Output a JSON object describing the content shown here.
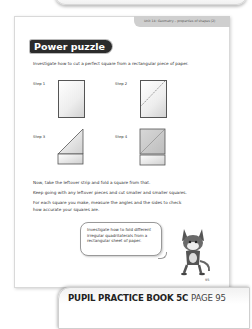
{
  "header": {
    "unit_label": "Unit 14: Geometry – properties of shapes (2)"
  },
  "section": {
    "title": "Power puzzle",
    "intro": "Investigate how to cut a perfect square from a rectangular piece of paper."
  },
  "steps": [
    {
      "label": "Step 1",
      "illustration": "rectangle-paper"
    },
    {
      "label": "Step 2",
      "illustration": "rectangle-paper-diagonal-fold-line"
    },
    {
      "label": "Step 3",
      "illustration": "folded-triangle-with-strip"
    },
    {
      "label": "Step 4",
      "illustration": "square-with-diagonal-and-strip"
    }
  ],
  "instructions": [
    "Now, take the leftover strip and fold a square from that.",
    "Keep going with any leftover pieces and cut smaller and smaller squares.",
    "For each square you make, measure the angles and the sides to check",
    "how accurate your squares are."
  ],
  "speech_bubble": {
    "lines": [
      "Investigate how to fold different",
      "irregular quadrilaterals from a",
      "rectangular sheet of paper."
    ]
  },
  "page_number": "95",
  "footer": {
    "book": "PUPIL PRACTICE BOOK 5C",
    "page": "PAGE 95"
  },
  "colors": {
    "title_badge_bg": "#2b2b2b",
    "unit_tab_bg": "#cfcfcf"
  }
}
